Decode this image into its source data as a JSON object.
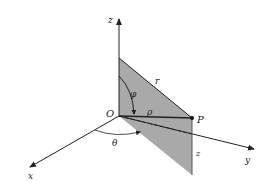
{
  "diagram": {
    "type": "spherical-cylindrical-coordinates",
    "labels": {
      "z_axis": "z",
      "x_axis": "x",
      "y_axis": "y",
      "origin": "O",
      "point": "P",
      "r": "r",
      "rho": "ρ",
      "phi": "φ",
      "theta": "θ",
      "z_height": "z"
    },
    "colors": {
      "plane_fill": "#a9a9a9",
      "lines": "#222222",
      "background": "#ffffff"
    }
  }
}
